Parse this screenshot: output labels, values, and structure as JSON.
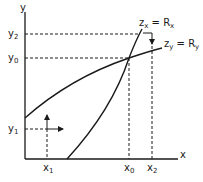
{
  "diagram": {
    "axes": {
      "x_label": "x",
      "y_label": "y"
    },
    "curves": [
      {
        "name": "zx-rx",
        "label_main": "z",
        "label_sub": "x",
        "label_eq": " = R",
        "label_eq_sub": "x"
      },
      {
        "name": "zy-ry",
        "label_main": "z",
        "label_sub": "y",
        "label_eq": " = R",
        "label_eq_sub": "y"
      }
    ],
    "y_ticks": [
      {
        "main": "y",
        "sub": "2"
      },
      {
        "main": "y",
        "sub": "0"
      },
      {
        "main": "y",
        "sub": "1"
      }
    ],
    "x_ticks": [
      {
        "main": "x",
        "sub": "1"
      },
      {
        "main": "x",
        "sub": "0"
      },
      {
        "main": "x",
        "sub": "2"
      }
    ]
  }
}
